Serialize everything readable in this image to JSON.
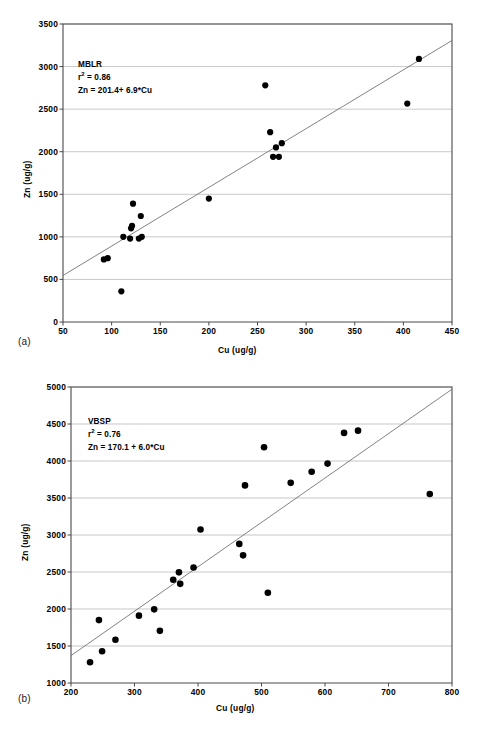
{
  "figure": {
    "panels": [
      {
        "id": "a",
        "label": "(a)",
        "group": "MBLR",
        "r2_text": "= 0.86",
        "r2_prefix": "r",
        "r2_sup": "2",
        "equation": "Zn = 201.4+ 6.9*Cu",
        "xlabel": "Cu (ug/g)",
        "ylabel": "Zn (ug/g)"
      },
      {
        "id": "b",
        "label": "(b)",
        "group": "VBSP",
        "r2_text": "= 0.76",
        "r2_prefix": "r",
        "r2_sup": "2",
        "equation": "Zn = 170.1 + 6.0*Cu",
        "xlabel": "Cu  (ug/g)",
        "ylabel": "Zn  (ug/g)"
      }
    ]
  },
  "chart_data": [
    {
      "type": "scatter",
      "panel": "a",
      "title": "MBLR",
      "xlabel": "Cu (ug/g)",
      "ylabel": "Zn (ug/g)",
      "xlim": [
        50,
        450
      ],
      "ylim": [
        0,
        3500
      ],
      "xticks": [
        50,
        100,
        150,
        200,
        250,
        300,
        350,
        400,
        450
      ],
      "yticks": [
        0,
        500,
        1000,
        1500,
        2000,
        2500,
        3000,
        3500
      ],
      "grid": "horizontal",
      "legend": "none",
      "annotations": [
        "MBLR",
        "r2 = 0.86",
        "Zn = 201.4+ 6.9*Cu"
      ],
      "regression": {
        "slope": 6.9,
        "intercept": 201.4,
        "r_squared": 0.86,
        "equation": "Zn = 201.4+ 6.9*Cu"
      },
      "x": [
        92,
        96,
        110,
        112,
        119,
        120,
        121,
        122,
        128,
        130,
        131,
        200,
        258,
        263,
        266,
        269,
        272,
        275,
        404,
        416
      ],
      "y": [
        735,
        750,
        360,
        1000,
        980,
        1100,
        1130,
        1390,
        980,
        1245,
        1000,
        1450,
        2780,
        2230,
        1940,
        2050,
        1940,
        2100,
        2565,
        3090
      ],
      "n_points": 20
    },
    {
      "type": "scatter",
      "panel": "b",
      "title": "VBSP",
      "xlabel": "Cu  (ug/g)",
      "ylabel": "Zn  (ug/g)",
      "xlim": [
        200,
        800
      ],
      "ylim": [
        1000,
        5000
      ],
      "xticks": [
        200,
        300,
        400,
        500,
        600,
        700,
        800
      ],
      "yticks": [
        1000,
        1500,
        2000,
        2500,
        3000,
        3500,
        4000,
        4500,
        5000
      ],
      "grid": "horizontal",
      "legend": "none",
      "annotations": [
        "VBSP",
        "r2 = 0.76",
        "Zn = 170.1 + 6.0*Cu"
      ],
      "regression": {
        "slope": 6.0,
        "intercept": 170.1,
        "r_squared": 0.76,
        "equation": "Zn = 170.1 + 6.0*Cu"
      },
      "x": [
        230,
        244,
        249,
        270,
        307,
        331,
        340,
        361,
        370,
        372,
        393,
        404,
        465,
        471,
        474,
        504,
        510,
        546,
        579,
        604,
        630,
        652,
        765
      ],
      "y": [
        1280,
        1850,
        1430,
        1585,
        1910,
        1995,
        1705,
        2395,
        2495,
        2340,
        2560,
        3075,
        2880,
        2725,
        3670,
        4185,
        2220,
        3705,
        3855,
        3965,
        4380,
        4410,
        3555
      ],
      "n_points": 23
    }
  ]
}
